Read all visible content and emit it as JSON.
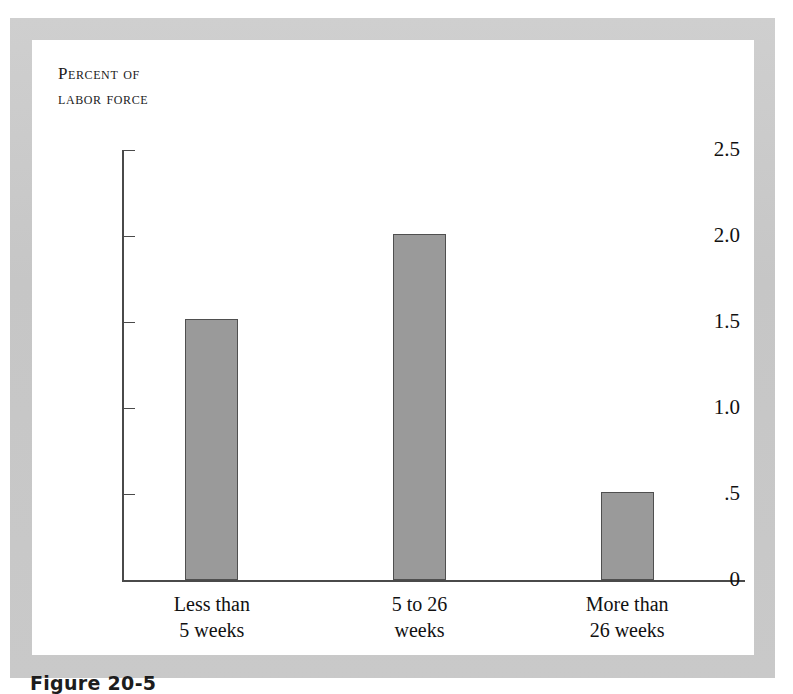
{
  "figure": {
    "caption": "Figure 20-5"
  },
  "chart_data": {
    "type": "bar",
    "title": "",
    "subtitle": "",
    "axis_title_lines": [
      "Percent of",
      "labor force"
    ],
    "xlabel": "",
    "ylabel": "Percent of labor force",
    "categories": [
      "Less than 5 weeks",
      "5 to 26 weeks",
      "More than 26 weeks"
    ],
    "category_label_lines": [
      [
        "Less than",
        "5 weeks"
      ],
      [
        "5 to 26",
        "weeks"
      ],
      [
        "More than",
        "26 weeks"
      ]
    ],
    "values": [
      1.52,
      2.01,
      0.51
    ],
    "ylim": [
      0,
      2.5
    ],
    "ytick_values": [
      2.5,
      2.0,
      1.5,
      1.0,
      0.5,
      0
    ],
    "ytick_labels": [
      "2.5",
      "2.0",
      "1.5",
      "1.0",
      ".5",
      "0"
    ],
    "grid": false,
    "legend": "none",
    "bar_color": "#9a9a9a",
    "bar_edge_color": "#4f4f4f",
    "axis_color": "#4a4a4a",
    "panel_background": "#ffffff",
    "frame_color": "#c9c9c9"
  }
}
